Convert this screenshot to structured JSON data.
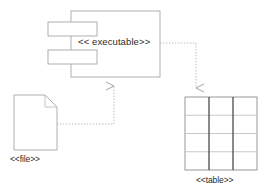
{
  "diagram": {
    "type": "uml-deployment-diagram",
    "background_color": "#ffffff",
    "stroke_color": "#999999",
    "dark_stroke_color": "#4a4a4a",
    "text_color": "#2b2b2b",
    "nodes": [
      {
        "id": "executable",
        "kind": "component",
        "label": "<< executable>>",
        "x": 71,
        "y": 11,
        "width": 89,
        "height": 66,
        "tabs": 2
      },
      {
        "id": "file",
        "kind": "artifact",
        "label": "<<file>>",
        "x": 14,
        "y": 95,
        "width": 43,
        "height": 55,
        "fold_size": 12
      },
      {
        "id": "table",
        "kind": "table",
        "label": "<<table>>",
        "x": 185,
        "y": 97,
        "width": 72,
        "height": 73,
        "rows": 4,
        "columns": 3
      }
    ],
    "connectors": [
      {
        "id": "executable-to-table",
        "from": "executable",
        "to": "table",
        "style": "dashed",
        "arrow": "open",
        "label": ""
      },
      {
        "id": "file-to-executable",
        "from": "file",
        "to": "executable",
        "style": "dashed",
        "arrow": "open",
        "label": ""
      }
    ]
  }
}
